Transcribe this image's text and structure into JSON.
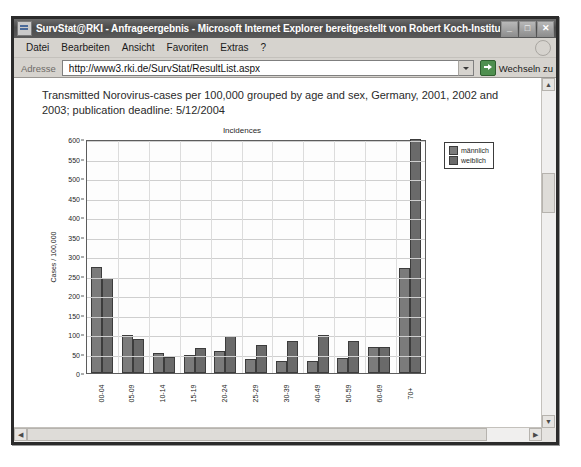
{
  "window": {
    "title": "SurvStat@RKI - Anfrageergebnis - Microsoft Internet Explorer bereitgestellt von Robert Koch-Institut",
    "minimize_label": "_",
    "maximize_label": "□",
    "close_label": "✕",
    "app_icon": "ie-document-icon"
  },
  "menu": {
    "items": [
      {
        "label": "Datei"
      },
      {
        "label": "Bearbeiten"
      },
      {
        "label": "Ansicht"
      },
      {
        "label": "Favoriten"
      },
      {
        "label": "Extras"
      },
      {
        "label": "?"
      }
    ],
    "brand_icon": "ie-logo-icon"
  },
  "address_bar": {
    "label": "Adresse",
    "url": "http://www3.rki.de/SurvStat/ResultList.aspx",
    "placeholder": "http://",
    "dropdown_icon": "chevron-down-icon",
    "go_label": "Wechseln zu",
    "go_icon": "go-arrow-icon"
  },
  "page": {
    "headline": "Transmitted Norovirus-cases per 100,000 grouped by age and sex, Germany, 2001, 2002 and 2003; publication deadline: 5/12/2004"
  },
  "scrollbars": {
    "vertical_up": "▲",
    "vertical_down": "▼",
    "horizontal_left": "◀",
    "horizontal_right": "▶"
  },
  "chart_data": {
    "type": "bar",
    "title": "Incidences",
    "xlabel": "",
    "ylabel": "Cases / 100,000",
    "ylim": [
      0,
      600
    ],
    "ytick_step": 50,
    "yticks": [
      0,
      50,
      100,
      150,
      200,
      250,
      300,
      350,
      400,
      450,
      500,
      550,
      600
    ],
    "grid": true,
    "legend_position": "top-right",
    "categories": [
      "00-04",
      "05-09",
      "10-14",
      "15-19",
      "20-24",
      "25-29",
      "30-39",
      "40-49",
      "50-59",
      "60-69",
      "70+"
    ],
    "series": [
      {
        "name": "männlich",
        "color": "#7b7b7b",
        "values": [
          272,
          97,
          52,
          46,
          57,
          37,
          32,
          32,
          38,
          67,
          268
        ]
      },
      {
        "name": "weiblich",
        "color": "#6a6a6a",
        "values": [
          243,
          87,
          42,
          63,
          96,
          73,
          81,
          97,
          83,
          67,
          604
        ]
      }
    ]
  }
}
